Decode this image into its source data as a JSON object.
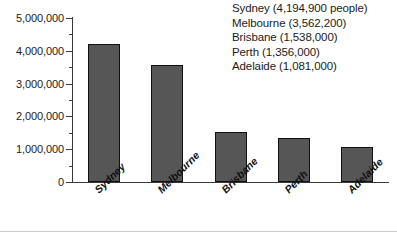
{
  "chart_data": {
    "type": "bar",
    "title": "",
    "xlabel": "",
    "ylabel": "",
    "categories": [
      "Sydney",
      "Melbourne",
      "Brisbane",
      "Perth",
      "Adelaide"
    ],
    "values": [
      4194900,
      3562200,
      1538000,
      1356000,
      1081000
    ],
    "ylim": [
      0,
      5000000
    ],
    "y_tick_step": 1000000,
    "y_minor_tick_step": 500000,
    "y_tick_labels": [
      "5,000,000",
      "4,000,000",
      "3,000,000",
      "2,000,000",
      "1,000,000",
      "0"
    ],
    "y_tick_values": [
      5000000,
      4000000,
      3000000,
      2000000,
      1000000,
      0
    ],
    "grid": false,
    "legend_position": "top-right",
    "bar_fill_color": "#565656",
    "bar_border_color": "#101010",
    "axis_color": "#3a3a3a",
    "text_color": "#1b1b1b",
    "background_color": "#ffffff"
  },
  "legend": {
    "lines": [
      "Sydney (4,194,900 people)",
      "Melbourne (3,562,200)",
      "Brisbane (1,538,000)",
      "Perth (1,356,000)",
      "Adelaide (1,081,000)"
    ]
  }
}
